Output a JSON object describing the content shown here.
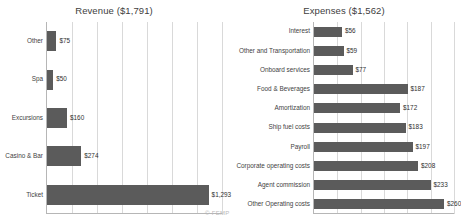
{
  "watermark": "© FEMP",
  "chart_data": [
    {
      "type": "bar",
      "orientation": "horizontal",
      "title": "Revenue ($1,791)",
      "total": 1791,
      "currency": "$",
      "xlabel": "",
      "ylabel": "",
      "xlim": [
        0,
        1400
      ],
      "grid": true,
      "gridline_count": 7,
      "legend": "none",
      "categories": [
        "Other",
        "Spa",
        "Excursions",
        "Casino & Bar",
        "Ticket"
      ],
      "values": [
        75,
        50,
        160,
        274,
        1293
      ],
      "value_labels": [
        "$75",
        "$50",
        "$160",
        "$274",
        "$1,293"
      ]
    },
    {
      "type": "bar",
      "orientation": "horizontal",
      "title": "Expenses ($1,562)",
      "total": 1562,
      "currency": "$",
      "xlabel": "",
      "ylabel": "",
      "xlim": [
        0,
        280
      ],
      "grid": true,
      "gridline_count": 6,
      "legend": "none",
      "categories": [
        "Interest",
        "Other and Transportation",
        "Onboard services",
        "Food & Beverages",
        "Amortization",
        "Ship fuel costs",
        "Payroll",
        "Corporate operating costs",
        "Agent commission",
        "Other Operating costs"
      ],
      "values": [
        56,
        59,
        77,
        187,
        172,
        183,
        197,
        208,
        233,
        260
      ],
      "value_labels": [
        "$56",
        "$59",
        "$77",
        "$187",
        "$172",
        "$183",
        "$197",
        "$208",
        "$233",
        "$260"
      ]
    }
  ],
  "colors": {
    "bar": "#5b5b5b",
    "gridline": "#d9d9d9",
    "axis": "#b6b6b6",
    "text": "#3f3f3f",
    "background": "#ffffff"
  }
}
